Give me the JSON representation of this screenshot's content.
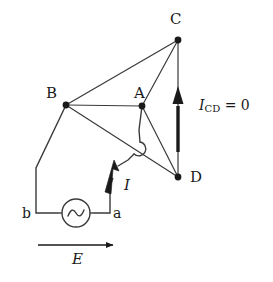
{
  "figure": {
    "type": "circuit-diagram",
    "width": 273,
    "height": 282,
    "background_color": "#ffffff",
    "line_color": "#3a3a3a",
    "node_color": "#1a1a1a",
    "arrow_color": "#1a1a1a"
  },
  "nodes": [
    {
      "id": "A",
      "label": "A",
      "x": 142,
      "y": 106,
      "label_x": 134,
      "label_y": 86
    },
    {
      "id": "B",
      "label": "B",
      "x": 66,
      "y": 105,
      "label_x": 46,
      "label_y": 86
    },
    {
      "id": "C",
      "label": "C",
      "x": 178,
      "y": 40,
      "label_x": 170,
      "label_y": 12
    },
    {
      "id": "D",
      "label": "D",
      "x": 178,
      "y": 177,
      "label_x": 190,
      "label_y": 170
    }
  ],
  "terminals": [
    {
      "id": "a",
      "label": "a",
      "x": 113,
      "y": 213
    },
    {
      "id": "b",
      "label": "b",
      "x": 22,
      "y": 213
    }
  ],
  "branches": [
    {
      "from": "B",
      "to": "C",
      "name": "branch-bc"
    },
    {
      "from": "B",
      "to": "A",
      "name": "branch-ba"
    },
    {
      "from": "B",
      "to": "D",
      "name": "branch-bd"
    },
    {
      "from": "A",
      "to": "C",
      "name": "branch-ac"
    },
    {
      "from": "A",
      "to": "D",
      "name": "branch-ad"
    },
    {
      "from": "C",
      "to": "D",
      "name": "branch-cd"
    }
  ],
  "source": {
    "name": "ac-voltage-source",
    "symbol": "sine-wave-in-circle",
    "center_x": 76,
    "center_y": 213,
    "radius": 14
  },
  "annotations": {
    "current_i": {
      "label": "I",
      "name": "current-arrow-i",
      "label_x": 124,
      "label_y": 178,
      "description": "total source current arrow"
    },
    "current_cd": {
      "symbol": "I",
      "subscript": "CD",
      "equals": " = 0",
      "full_text": "I_CD = 0",
      "name": "current-cd-annotation",
      "label_x": 199,
      "label_y": 98,
      "description": "null current in the CD branch indicating bridge balance"
    },
    "emf_e": {
      "label": "E",
      "name": "emf-arrow-e",
      "label_x": 72,
      "label_y": 252,
      "arrow_x1": 38,
      "arrow_x2": 118,
      "arrow_y": 245,
      "description": "applied EMF direction arrow"
    }
  },
  "wires": {
    "left_return": {
      "name": "wire-b-to-terminal-b",
      "description": "from node B down-left, then vertical, then right to terminal b"
    },
    "right_feed": {
      "name": "wire-terminal-a-to-node-a",
      "description": "from terminal a up, with wire hop over branch B-D, then to node A"
    },
    "hop": {
      "name": "wire-crossover-hop",
      "description": "semicircular jump where the feed wire crosses branch B-D without connecting"
    }
  }
}
